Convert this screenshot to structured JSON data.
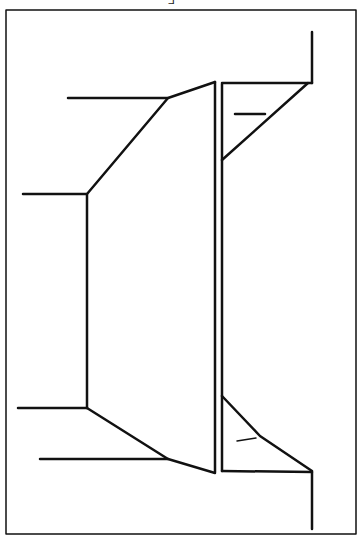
{
  "figure": {
    "label": "F",
    "stroke_color": "#111111",
    "background": "#ffffff"
  }
}
